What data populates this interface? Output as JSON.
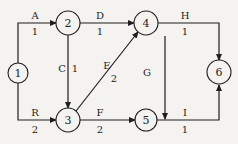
{
  "diagram": {
    "type": "activity-on-arrow network",
    "nodes": [
      {
        "id": "1",
        "label": "1"
      },
      {
        "id": "2",
        "label": "2"
      },
      {
        "id": "3",
        "label": "3"
      },
      {
        "id": "4",
        "label": "4"
      },
      {
        "id": "5",
        "label": "5"
      },
      {
        "id": "6",
        "label": "6"
      }
    ],
    "edges": [
      {
        "name": "A",
        "duration": "1",
        "from": "1",
        "to": "2"
      },
      {
        "name": "R",
        "duration": "2",
        "from": "1",
        "to": "3"
      },
      {
        "name": "D",
        "duration": "1",
        "from": "2",
        "to": "4"
      },
      {
        "name": "C",
        "duration": "1",
        "from": "2",
        "to": "3"
      },
      {
        "name": "E",
        "duration": "2",
        "from": "3",
        "to": "4"
      },
      {
        "name": "F",
        "duration": "2",
        "from": "3",
        "to": "5"
      },
      {
        "name": "G",
        "duration": "",
        "from": "4",
        "to": "5"
      },
      {
        "name": "H",
        "duration": "1",
        "from": "4",
        "to": "6"
      },
      {
        "name": "I",
        "duration": "1",
        "from": "5",
        "to": "6"
      }
    ]
  }
}
